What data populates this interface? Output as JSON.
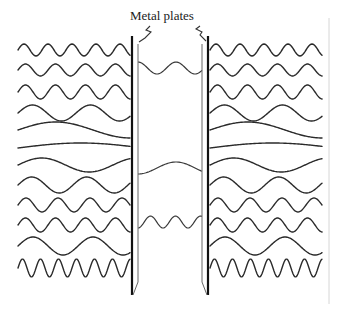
{
  "diagram": {
    "label": "Metal plates",
    "colors": {
      "line": "#2a2a2a",
      "plate": "#111111",
      "background": "#ffffff"
    },
    "plates": [
      {
        "name": "left",
        "x": 132,
        "top": 36,
        "bottom": 295
      },
      {
        "name": "right",
        "x": 208,
        "top": 36,
        "bottom": 295
      }
    ],
    "outside_waves": [
      {
        "y": 50,
        "amp": 6,
        "wavelength": 24
      },
      {
        "y": 70,
        "amp": 6,
        "wavelength": 30
      },
      {
        "y": 92,
        "amp": 7,
        "wavelength": 30
      },
      {
        "y": 113,
        "amp": 8,
        "wavelength": 58
      },
      {
        "y": 130,
        "amp": 8,
        "wavelength": 150
      },
      {
        "y": 148,
        "amp": 5,
        "wavelength": 250
      },
      {
        "y": 165,
        "amp": 7,
        "wavelength": 95
      },
      {
        "y": 185,
        "amp": 8,
        "wavelength": 55
      },
      {
        "y": 205,
        "amp": 7,
        "wavelength": 32
      },
      {
        "y": 225,
        "amp": 7,
        "wavelength": 30
      },
      {
        "y": 246,
        "amp": 9,
        "wavelength": 60
      },
      {
        "y": 268,
        "amp": 9,
        "wavelength": 18
      }
    ],
    "inside_waves": [
      {
        "y": 68,
        "amp": 6,
        "wavelength": 38,
        "phase": 0.25
      },
      {
        "y": 168,
        "amp": 6,
        "wavelength": 76,
        "phase": 0.75
      },
      {
        "y": 222,
        "amp": 6,
        "wavelength": 25,
        "phase": 0.75
      }
    ]
  }
}
